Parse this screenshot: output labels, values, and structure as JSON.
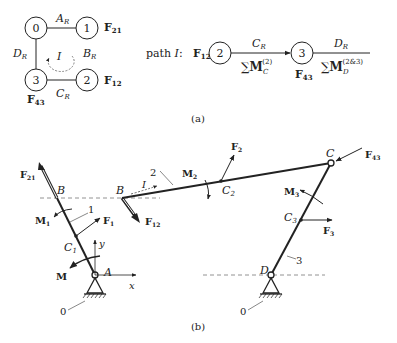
{
  "figure_a": {
    "caption": "(a)",
    "graph": {
      "nodes": [
        {
          "id": "0",
          "label": "0"
        },
        {
          "id": "1",
          "label": "1",
          "force": "F",
          "force_sub": "21"
        },
        {
          "id": "2",
          "label": "2",
          "force": "F",
          "force_sub": "12"
        },
        {
          "id": "3",
          "label": "3",
          "force": "F",
          "force_sub": "43"
        }
      ],
      "edges": [
        {
          "from": "0",
          "to": "1",
          "label": "A",
          "label_sub": "R"
        },
        {
          "from": "1",
          "to": "2",
          "label": "B",
          "label_sub": "R",
          "note": "virtual (no line)"
        },
        {
          "from": "2",
          "to": "3",
          "label": "C",
          "label_sub": "R"
        },
        {
          "from": "3",
          "to": "0",
          "label": "D",
          "label_sub": "R"
        }
      ],
      "loop_label": "I"
    },
    "path": {
      "prefix": "path ",
      "name": "I",
      "suffix": ":",
      "start_force": "F",
      "start_force_sub": "12",
      "nodes": [
        "2",
        "3"
      ],
      "node3_force": "F",
      "node3_force_sub": "43",
      "segments": [
        {
          "top": "C",
          "top_sub": "R",
          "bottom_sum": "∑",
          "bottom_M": "M",
          "bottom_sub": "C",
          "bottom_sup": "(2)"
        },
        {
          "top": "D",
          "top_sub": "R",
          "bottom_sum": "∑",
          "bottom_M": "M",
          "bottom_sub": "D",
          "bottom_sup": "(2&3)"
        }
      ]
    }
  },
  "figure_b": {
    "caption": "(b)",
    "points": {
      "A": "A",
      "B1": "B",
      "B2": "B",
      "C": "C",
      "D": "D",
      "C1": "C",
      "C1_sub": "1",
      "C2": "C",
      "C2_sub": "2",
      "C3": "C",
      "C3_sub": "3"
    },
    "links": {
      "l1": "1",
      "l2": "2",
      "l3": "3",
      "ground_a": "0",
      "ground_d": "0"
    },
    "forces": {
      "F21": {
        "b": "F",
        "sub": "21"
      },
      "F12": {
        "b": "F",
        "sub": "12"
      },
      "F43": {
        "b": "F",
        "sub": "43"
      },
      "F1": {
        "b": "F",
        "sub": "1"
      },
      "F2": {
        "b": "F",
        "sub": "2"
      },
      "F3": {
        "b": "F",
        "sub": "3"
      }
    },
    "moments": {
      "M": {
        "b": "M",
        "sub": ""
      },
      "M1": {
        "b": "M",
        "sub": "1"
      },
      "M2": {
        "b": "M",
        "sub": "2"
      },
      "M3": {
        "b": "M",
        "sub": "3"
      }
    },
    "axes": {
      "x": "x",
      "y": "y"
    },
    "loop_label": "I"
  },
  "colors": {
    "ink": "#222222",
    "dash": "#777777",
    "background": "#ffffff"
  }
}
